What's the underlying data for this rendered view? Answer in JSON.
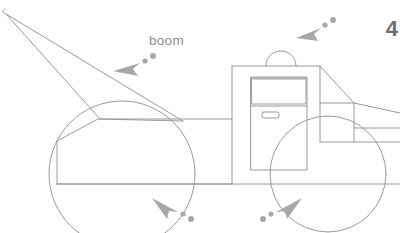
{
  "figure": {
    "background_color": "#ffffff",
    "line_color": "#9a9a9a",
    "annotation_color": "#a8a8a8",
    "text_color": "#8d8d8d",
    "page_number_color": "#6e6e6e"
  },
  "labels": {
    "boom": "boom"
  },
  "page_number": "4",
  "annotations": [
    {
      "name": "boom-pointer",
      "points_to": "boom",
      "direction": "down-left",
      "dots": 2
    },
    {
      "name": "dome-light-pointer",
      "points_to": "dome-light",
      "direction": "down-left",
      "dots": 3
    },
    {
      "name": "rear-wheel-pointer",
      "points_to": "rear-wheel",
      "direction": "up-left",
      "dots": 2
    },
    {
      "name": "front-wheel-pointer",
      "points_to": "front-wheel",
      "direction": "up-right",
      "dots": 2
    }
  ],
  "parts": [
    "boom",
    "truck-bed",
    "cab",
    "door",
    "door-window",
    "door-handle",
    "dome-light",
    "windshield",
    "hood",
    "rear-wheel",
    "front-wheel",
    "ground-line"
  ]
}
